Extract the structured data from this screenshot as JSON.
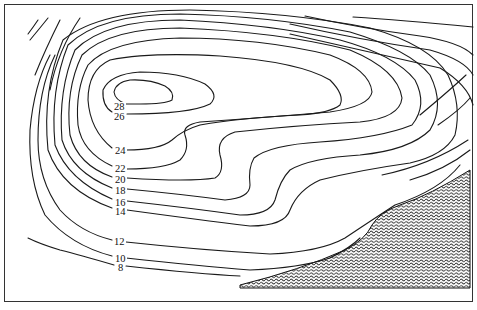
{
  "figure": {
    "type": "contour-map",
    "contour_labels": [
      "28",
      "26",
      "24",
      "22",
      "20",
      "18",
      "16",
      "14",
      "12",
      "10",
      "8"
    ],
    "label_positions": [
      {
        "value": "28",
        "x": 113,
        "y": 102
      },
      {
        "value": "26",
        "x": 113,
        "y": 112
      },
      {
        "value": "24",
        "x": 114,
        "y": 146
      },
      {
        "value": "22",
        "x": 114,
        "y": 164
      },
      {
        "value": "20",
        "x": 114,
        "y": 175
      },
      {
        "value": "18",
        "x": 114,
        "y": 186
      },
      {
        "value": "16",
        "x": 114,
        "y": 198
      },
      {
        "value": "14",
        "x": 114,
        "y": 207
      },
      {
        "value": "12",
        "x": 113,
        "y": 237
      },
      {
        "value": "10",
        "x": 114,
        "y": 254
      },
      {
        "value": "8",
        "x": 117,
        "y": 263
      }
    ],
    "hatched_region": {
      "description": "shaded area lower right",
      "color": "#111111"
    },
    "line_color": "#1a1a1a",
    "border_color": "#333333"
  }
}
